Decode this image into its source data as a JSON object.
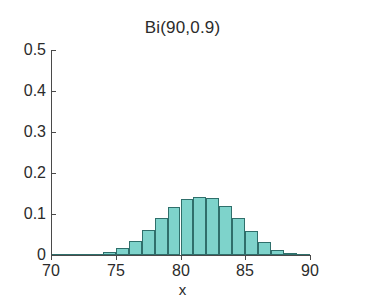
{
  "chart_data": {
    "type": "bar",
    "title": "Bi(90,0.9)",
    "xlabel": "x",
    "ylabel": "",
    "xlim": [
      70,
      90
    ],
    "ylim": [
      0,
      0.5
    ],
    "grid": false,
    "legend": null,
    "xticks": [
      "70",
      "75",
      "80",
      "85",
      "90"
    ],
    "xtick_values": [
      70,
      75,
      80,
      85,
      90
    ],
    "yticks": [
      "0",
      "0.1",
      "0.2",
      "0.3",
      "0.4",
      "0.5"
    ],
    "ytick_values": [
      0,
      0.1,
      0.2,
      0.3,
      0.4,
      0.5
    ],
    "bar_width": 1,
    "categories": [
      70,
      71,
      72,
      73,
      74,
      75,
      76,
      77,
      78,
      79,
      80,
      81,
      82,
      83,
      84,
      85,
      86,
      87,
      88,
      89
    ],
    "values": [
      0.0,
      0.0,
      0.001,
      0.003,
      0.008,
      0.018,
      0.035,
      0.06,
      0.09,
      0.118,
      0.136,
      0.141,
      0.138,
      0.119,
      0.09,
      0.058,
      0.031,
      0.013,
      0.004,
      0.001
    ],
    "series": [
      {
        "name": "Bi(90,0.9) pmf",
        "values": [
          0.0,
          0.0,
          0.001,
          0.003,
          0.008,
          0.018,
          0.035,
          0.06,
          0.09,
          0.118,
          0.136,
          0.141,
          0.138,
          0.119,
          0.09,
          0.058,
          0.031,
          0.013,
          0.004,
          0.001
        ]
      }
    ],
    "colors": {
      "bar_fill": "#7ed3cb",
      "bar_edge": "#2f6f6b",
      "axis": "#4a4a4a",
      "text": "#2b2b2b",
      "background": "#ffffff"
    }
  }
}
